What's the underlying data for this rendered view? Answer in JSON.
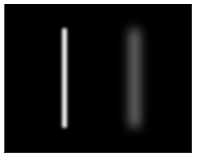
{
  "page": {
    "background_color": "#ffffff",
    "width": 203,
    "height": 160
  },
  "image_canvas": {
    "name": "image-canvas",
    "background_color": "#000000",
    "left": 4,
    "top": 4,
    "width": 188,
    "height": 149
  },
  "chart_data": {
    "type": "heatmap",
    "title": "",
    "subtitle": "",
    "xlabel": "",
    "ylabel": "",
    "grid": false,
    "legend_position": "none",
    "background_intensity": 0,
    "intensity_range": [
      0,
      255
    ],
    "colormap": "gray",
    "x": [
      64,
      134
    ],
    "values": [
      242,
      138
    ],
    "categories": [
      "sharp-line",
      "blurred-line"
    ],
    "series": [
      {
        "name": "peak_intensity",
        "values": [
          242,
          138
        ]
      },
      {
        "name": "line_width_px",
        "values": [
          5,
          9
        ]
      },
      {
        "name": "blur_sigma_px",
        "values": [
          1.4,
          5.2
        ]
      }
    ],
    "objects": [
      {
        "name": "sharp-line",
        "center_x": 64,
        "center_y": 78,
        "width": 5,
        "height": 100,
        "top": 28,
        "bottom": 128,
        "peak_intensity": 242,
        "peak_color": "#f2f2f2",
        "blur_sigma_px": 1.4,
        "contrast": "high"
      },
      {
        "name": "blurred-line",
        "center_x": 134,
        "center_y": 78,
        "width": 9,
        "height": 98,
        "top": 29,
        "bottom": 127,
        "peak_intensity": 138,
        "peak_color": "#8a8a8a",
        "blur_sigma_px": 5.2,
        "contrast": "low"
      }
    ]
  },
  "bars": [
    {
      "name": "sharp-line",
      "left": 58,
      "top": 24,
      "width": 5,
      "height": 100,
      "color": "#f2f2f2",
      "blur": "1.4px"
    },
    {
      "name": "blurred-line",
      "left": 126,
      "top": 25,
      "width": 9,
      "height": 98,
      "color": "#8a8a8a",
      "blur": "5.2px"
    }
  ]
}
